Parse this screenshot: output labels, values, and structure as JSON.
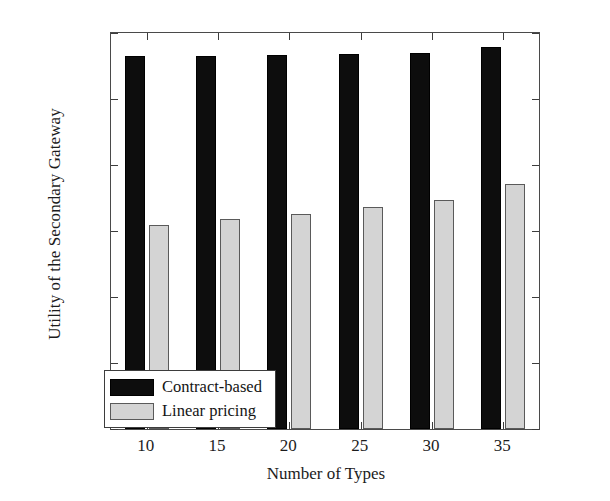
{
  "chart_data": {
    "type": "bar",
    "title": "",
    "xlabel": "Number of Types",
    "ylabel": "Utility of the Secondary Gateway",
    "categories": [
      "10",
      "15",
      "20",
      "25",
      "30",
      "35"
    ],
    "series": [
      {
        "name": "Contract-based",
        "color": "#0d0d0d",
        "values": [
          1131,
          1131,
          1134,
          1135,
          1138,
          1157
        ]
      },
      {
        "name": "Linear pricing",
        "color": "#d4d4d4",
        "values": [
          618,
          636,
          651,
          672,
          693,
          741
        ]
      }
    ],
    "ylim": [
      0,
      1200
    ],
    "yticks": [
      "0",
      "200",
      "400",
      "600",
      "800",
      "1000",
      "1200"
    ],
    "ytick_values": [
      0,
      200,
      400,
      600,
      800,
      1000,
      1200
    ],
    "xticks": [
      "10",
      "15",
      "20",
      "25",
      "30",
      "35"
    ],
    "grid": false,
    "legend_position": "lower left",
    "legend_entries": [
      "Contract-based",
      "Linear pricing"
    ]
  },
  "axis": {
    "y_title": "Utility of the Secondary Gateway",
    "x_title": "Number of Types"
  },
  "legend": {
    "entries": [
      {
        "label": "Contract-based"
      },
      {
        "label": "Linear pricing"
      }
    ]
  }
}
